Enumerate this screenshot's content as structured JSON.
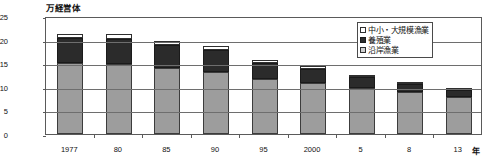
{
  "chart_data": {
    "type": "bar",
    "title": "",
    "subtitle": "",
    "unit_caption": "万経営体",
    "xlabel": "年",
    "ylabel": "",
    "ylim": [
      0,
      25
    ],
    "yticks": [
      "0",
      "5",
      "10",
      "15",
      "20",
      "25"
    ],
    "ytick_values": [
      0,
      5,
      10,
      15,
      20,
      25
    ],
    "grid": true,
    "stacked": true,
    "legend_position": "top-right",
    "categories": [
      "1977",
      "80",
      "85",
      "90",
      "95",
      "2000",
      "5",
      "8",
      "13"
    ],
    "series": [
      {
        "name": "沿岸漁業",
        "key": "coastal",
        "color": "#9d9d9d",
        "values": [
          15.1,
          14.8,
          14.0,
          13.2,
          11.6,
          10.8,
          9.7,
          8.8,
          7.9
        ]
      },
      {
        "name": "養殖業",
        "key": "aquaculture",
        "color": "#2b2b2b",
        "values": [
          5.2,
          5.4,
          4.9,
          4.6,
          3.5,
          3.0,
          2.4,
          1.9,
          1.5
        ]
      },
      {
        "name": "中小・大規模漁業",
        "key": "offshore",
        "color": "#ffffff",
        "values": [
          0.9,
          1.0,
          0.8,
          0.8,
          0.6,
          0.6,
          0.5,
          0.4,
          0.3
        ]
      }
    ],
    "totals": [
      21.2,
      21.2,
      19.7,
      18.6,
      15.7,
      14.4,
      12.6,
      11.1,
      9.7
    ]
  },
  "legend": {
    "items": [
      {
        "label": "中小・大規模漁業",
        "swatch": "offshore-swatch"
      },
      {
        "label": "養殖業",
        "swatch": "aquaculture-swatch"
      },
      {
        "label": "沿岸漁業",
        "swatch": "coastal-swatch"
      }
    ]
  }
}
